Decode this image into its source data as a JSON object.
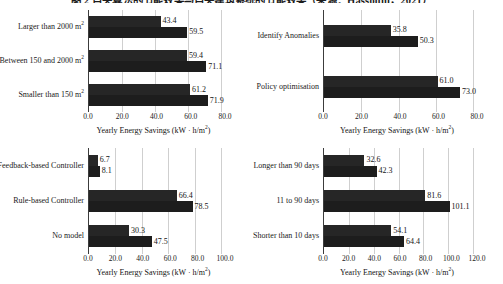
{
  "figure": {
    "caption": "图 2  自关算法的节能效果与自关建筑系统的节能效果（来源：Hassouni，2021）",
    "axis_title": "Yearly Energy Savings",
    "axis_unit": "(kW · h/m2)"
  },
  "chart_data": [
    {
      "id": "top-left",
      "type": "bar",
      "orientation": "horizontal",
      "title": "",
      "xlabel": "Yearly Energy Savings  (kW · h/m2)",
      "ylabel": "",
      "xlim": [
        0,
        80
      ],
      "xticks": [
        "0.0",
        "20.0",
        "40.0",
        "60.0",
        "80.0"
      ],
      "xtick_values": [
        0,
        20,
        40,
        60,
        80
      ],
      "grid": true,
      "legend": "none",
      "categories": [
        "Larger than 2000 m2",
        "Between 150 and 2000 m2",
        "Smaller than 150 m2"
      ],
      "series": [
        {
          "name": "series-1",
          "values": [
            43.4,
            59.4,
            61.2
          ]
        },
        {
          "name": "series-2",
          "values": [
            59.5,
            71.1,
            71.9
          ]
        }
      ]
    },
    {
      "id": "top-right",
      "type": "bar",
      "orientation": "horizontal",
      "title": "",
      "xlabel": "Yearly Energy Savings  (kW · h/m2)",
      "ylabel": "",
      "xlim": [
        0,
        80
      ],
      "xticks": [
        "0.0",
        "20.0",
        "40.0",
        "60.0",
        "80.0"
      ],
      "xtick_values": [
        0,
        20,
        40,
        60,
        80
      ],
      "grid": true,
      "legend": "none",
      "categories": [
        "Identify Anomalies",
        "Policy optimisation"
      ],
      "series": [
        {
          "name": "series-1",
          "values": [
            35.8,
            61.0
          ]
        },
        {
          "name": "series-2",
          "values": [
            50.3,
            73.0
          ]
        }
      ]
    },
    {
      "id": "bottom-left",
      "type": "bar",
      "orientation": "horizontal",
      "title": "",
      "xlabel": "Yearly Energy Savings  (kW · h/m2)",
      "ylabel": "",
      "xlim": [
        0,
        100
      ],
      "xticks": [
        "0.0",
        "20.0",
        "40.0",
        "60.0",
        "80.0",
        "100.0"
      ],
      "xtick_values": [
        0,
        20,
        40,
        60,
        80,
        100
      ],
      "grid": true,
      "legend": "none",
      "categories": [
        "Feedback-based Controller",
        "Rule-based Controller",
        "No model"
      ],
      "series": [
        {
          "name": "series-1",
          "values": [
            6.7,
            66.4,
            30.3
          ]
        },
        {
          "name": "series-2",
          "values": [
            8.1,
            78.5,
            47.5
          ]
        }
      ]
    },
    {
      "id": "bottom-right",
      "type": "bar",
      "orientation": "horizontal",
      "title": "",
      "xlabel": "Yearly Energy Savings  (kW · h/m2)",
      "ylabel": "",
      "xlim": [
        0,
        120
      ],
      "xticks": [
        "0.0",
        "20.0",
        "40.0",
        "60.0",
        "80.0",
        "100.0",
        "120.0"
      ],
      "xtick_values": [
        0,
        20,
        40,
        60,
        80,
        100,
        120
      ],
      "grid": true,
      "legend": "none",
      "categories": [
        "Longer than 90 days",
        "11 to 90 days",
        "Shorter than 10 days"
      ],
      "series": [
        {
          "name": "series-1",
          "values": [
            32.6,
            81.6,
            54.1
          ]
        },
        {
          "name": "series-2",
          "values": [
            42.3,
            101.1,
            64.4
          ]
        }
      ]
    }
  ],
  "colors": {
    "bar_primary": "#262626",
    "bar_secondary": "#1d1d1d",
    "gridline": "#cfcfcf",
    "axis": "#3c3c3c",
    "text": "#1a1a1a"
  }
}
